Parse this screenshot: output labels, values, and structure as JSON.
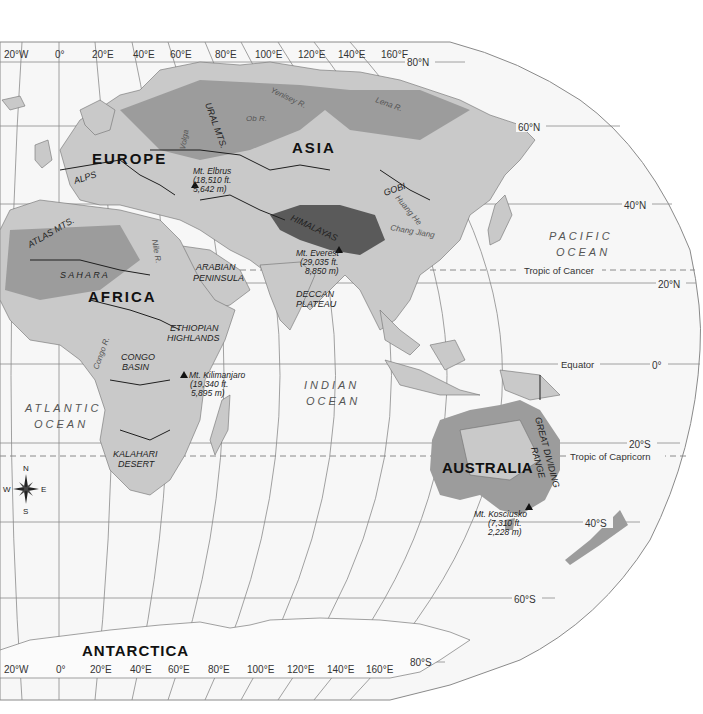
{
  "map": {
    "title": "Eastern Hemisphere Physical Map",
    "longitude_labels_top": [
      "20°W",
      "0°",
      "20°E",
      "40°E",
      "60°E",
      "80°E",
      "100°E",
      "120°E",
      "140°E",
      "160°E"
    ],
    "longitude_labels_bottom": [
      "20°W",
      "0°",
      "20°E",
      "40°E",
      "60°E",
      "80°E",
      "100°E",
      "120°E",
      "140°E",
      "160°E"
    ],
    "latitude_labels": {
      "n80": "80°N",
      "n60": "60°N",
      "n40": "40°N",
      "n20": "20°N",
      "eq": "0°",
      "s20": "20°S",
      "s40": "40°S",
      "s60": "60°S",
      "s80": "80°S"
    },
    "special_lines": {
      "tropic_cancer": "Tropic of Cancer",
      "equator": "Equator",
      "tropic_capricorn": "Tropic of Capricorn"
    },
    "continents": {
      "europe": "EUROPE",
      "asia": "ASIA",
      "africa": "AFRICA",
      "australia": "AUSTRALIA",
      "antarctica": "ANTARCTICA"
    },
    "oceans": {
      "pacific_1": "PACIFIC",
      "pacific_2": "OCEAN",
      "indian_1": "INDIAN",
      "indian_2": "OCEAN",
      "atlantic_1": "ATLANTIC",
      "atlantic_2": "OCEAN"
    },
    "regions": {
      "alps": "ALPS",
      "ural": "URAL MTS.",
      "atlas": "ATLAS MTS.",
      "sahara": "S A H A R A",
      "arabian_1": "ARABIAN",
      "arabian_2": "PENINSULA",
      "himalayas": "HIMALAYAS",
      "gobi": "GOBI",
      "deccan_1": "DECCAN",
      "deccan_2": "PLATEAU",
      "ethiopian_1": "ETHIOPIAN",
      "ethiopian_2": "HIGHLANDS",
      "congo_1": "CONGO",
      "congo_2": "BASIN",
      "kalahari_1": "KALAHARI",
      "kalahari_2": "DESERT",
      "great_dividing_1": "GREAT DIVIDING",
      "great_dividing_2": "RANGE"
    },
    "rivers": {
      "ob": "Ob R.",
      "yenisey": "Yenisey R.",
      "lena": "Lena R.",
      "volga": "Volga",
      "nile": "Nile R.",
      "congo": "Congo R.",
      "huang": "Huang He",
      "chang": "Chang Jiang"
    },
    "peaks": {
      "elbrus": {
        "name": "Mt. Elbrus",
        "ft": "(18,510 ft.",
        "m": "5,642 m)"
      },
      "everest": {
        "name": "Mt. Everest",
        "ft": "(29,035 ft.",
        "m": "8,850 m)"
      },
      "kilimanjaro": {
        "name": "Mt. Kilimanjaro",
        "ft": "(19,340 ft.",
        "m": "5,895 m)"
      },
      "kosciusko": {
        "name": "Mt. Kosciusko",
        "ft": "(7,310 ft.",
        "m": "2,228 m)"
      }
    },
    "compass": {
      "n": "N",
      "s": "S",
      "e": "E",
      "w": "W"
    }
  }
}
